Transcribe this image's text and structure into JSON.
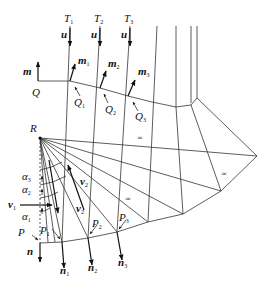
{
  "diagram": {
    "points": {
      "R": "R",
      "Q": "Q",
      "P": "P"
    },
    "top_labels": [
      {
        "main": "T",
        "sub": "1"
      },
      {
        "main": "T",
        "sub": "2"
      },
      {
        "main": "T",
        "sub": "3"
      }
    ],
    "u_labels": [
      "u",
      "u",
      "u"
    ],
    "m_label": "m",
    "m_labels": [
      {
        "main": "m",
        "sub": "1"
      },
      {
        "main": "m",
        "sub": "2"
      },
      {
        "main": "m",
        "sub": "3"
      }
    ],
    "Q_labels": [
      {
        "main": "Q",
        "sub": "1"
      },
      {
        "main": "Q",
        "sub": "2"
      },
      {
        "main": "Q",
        "sub": "3"
      }
    ],
    "P_labels": [
      {
        "main": "P",
        "sub": "1"
      },
      {
        "main": "P",
        "sub": "2"
      },
      {
        "main": "P",
        "sub": "3"
      }
    ],
    "n_label": "n",
    "n_labels": [
      {
        "main": "n",
        "sub": "1"
      },
      {
        "main": "n",
        "sub": "2"
      },
      {
        "main": "n",
        "sub": "3"
      }
    ],
    "alpha_labels": [
      {
        "main": "α",
        "sub": "3"
      },
      {
        "main": "α",
        "sub": "2"
      },
      {
        "main": "α",
        "sub": "1"
      }
    ],
    "v_labels": [
      {
        "main": "v",
        "sub": "1"
      },
      {
        "main": "v",
        "sub": "2"
      },
      {
        "main": "v",
        "sub": "2"
      }
    ],
    "equal_marks": [
      "≈",
      "≈",
      "≈"
    ]
  }
}
